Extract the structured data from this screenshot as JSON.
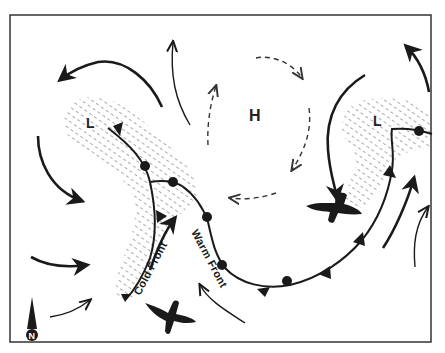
{
  "diagram": {
    "type": "weather-map",
    "colors": {
      "background": "#ffffff",
      "ink": "#1a1a1a",
      "frame": "#333333",
      "hatch": "#555555"
    },
    "pressure_centers": [
      {
        "id": "low-west",
        "label": "L"
      },
      {
        "id": "high-center",
        "label": "H"
      },
      {
        "id": "low-east",
        "label": "L"
      }
    ],
    "fronts": [
      {
        "id": "cold-front",
        "label": "Cold Front",
        "symbol": "triangles"
      },
      {
        "id": "warm-front",
        "label": "Warm Front",
        "symbol": "semicircles"
      }
    ],
    "compass": {
      "label": "N"
    },
    "icons": [
      "bird-silhouette-icon",
      "north-arrow-icon",
      "wind-arrow-icon"
    ]
  }
}
